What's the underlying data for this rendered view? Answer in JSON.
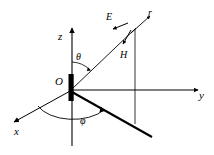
{
  "figure": {
    "kind": "spherical-coordinate-dipole-diagram",
    "background_color": "#ffffff",
    "stroke_color": "#000000"
  },
  "axes": {
    "z": {
      "label": "z"
    },
    "y": {
      "label": "y"
    },
    "x": {
      "label": "x"
    }
  },
  "origin": {
    "label": "O"
  },
  "angles": {
    "theta": {
      "label": "θ"
    },
    "phi": {
      "label": "φ"
    }
  },
  "vectors": {
    "r": {
      "label": "r"
    },
    "E": {
      "label": "E"
    },
    "H": {
      "label": "H"
    }
  }
}
